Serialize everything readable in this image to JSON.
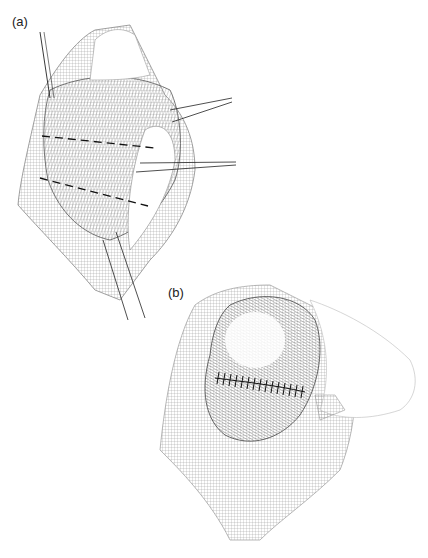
{
  "figure": {
    "panels": [
      {
        "label": "(a)",
        "description": "Surgical illustration with retractors and dashed incision lines"
      },
      {
        "label": "(b)",
        "description": "Surgical illustration showing sutured closure"
      }
    ]
  }
}
